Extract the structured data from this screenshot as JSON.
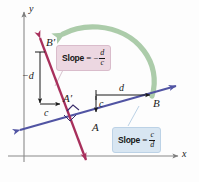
{
  "figure": {
    "background": "#fdfdfd"
  },
  "axes": {
    "x_label": "x",
    "y_label": "y",
    "color": "#8a8a8a"
  },
  "lines": [
    {
      "name": "blue-line",
      "color": "#5154a3",
      "slope_sign": "positive",
      "points": [
        "A",
        "B"
      ]
    },
    {
      "name": "crimson-line",
      "color": "#a8305c",
      "slope_sign": "negative",
      "points": [
        "A'",
        "B'"
      ]
    }
  ],
  "point_labels": {
    "a": "A",
    "b": "B",
    "a_prime": "A′",
    "b_prime": "B′"
  },
  "segment_labels": {
    "run_blue": "d",
    "rise_blue": "c",
    "run_crimson": "c",
    "rise_crimson": "−d"
  },
  "callouts": [
    {
      "name": "negative-slope",
      "keyword": "Slope",
      "equals": "=",
      "negative": "−",
      "numerator": "d",
      "denominator": "c",
      "background": "#ecd7e1"
    },
    {
      "name": "positive-slope",
      "keyword": "Slope",
      "equals": "=",
      "negative": "",
      "numerator": "c",
      "denominator": "d",
      "background": "#d8e6f2"
    }
  ],
  "rotation_arrow": {
    "name": "green-rotation-arrow",
    "color": "#9ec49c",
    "direction": "counterclockwise"
  },
  "right_angle_marker": {
    "name": "right-angle-marker",
    "color": "#3a2d6b"
  }
}
